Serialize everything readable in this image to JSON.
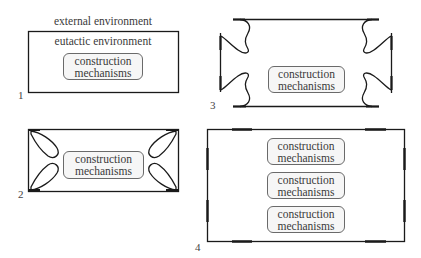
{
  "panels": [
    {
      "number": "1",
      "outer_label": "external environment",
      "inner_label": "eutactic environment",
      "mechanisms": [
        {
          "line1": "construction",
          "line2": "mechanisms"
        }
      ]
    },
    {
      "number": "2",
      "mechanisms": [
        {
          "line1": "construction",
          "line2": "mechanisms"
        }
      ]
    },
    {
      "number": "3",
      "mechanisms": [
        {
          "line1": "construction",
          "line2": "mechanisms"
        }
      ]
    },
    {
      "number": "4",
      "mechanisms": [
        {
          "line1": "construction",
          "line2": "mechanisms"
        },
        {
          "line1": "construction",
          "line2": "mechanisms"
        },
        {
          "line1": "construction",
          "line2": "mechanisms"
        }
      ]
    }
  ],
  "colors": {
    "stroke": "#1a1a1a",
    "box_fill": "#f6f6f6",
    "text": "#3a3a3a"
  }
}
